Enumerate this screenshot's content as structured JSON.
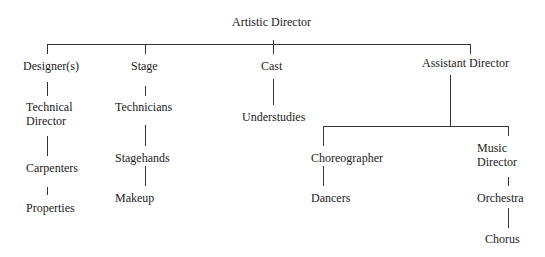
{
  "title": "Artistic Director",
  "nodes": {
    "artistic_director": "Artistic Director",
    "designers": "Designer(s)",
    "technical_director_1": "Technical",
    "technical_director_2": "Director",
    "carpenters": "Carpenters",
    "properties": "Properties",
    "stage": "Stage",
    "technicians": "Technicians",
    "stagehands": "Stagehands",
    "makeup": "Makeup",
    "cast": "Cast",
    "understudies": "Understudies",
    "assistant_director": "Assistant Director",
    "choreographer": "Choreographer",
    "dancers": "Dancers",
    "music_director_1": "Music",
    "music_director_2": "Director",
    "orchestra": "Orchestra",
    "chorus": "Chorus"
  }
}
